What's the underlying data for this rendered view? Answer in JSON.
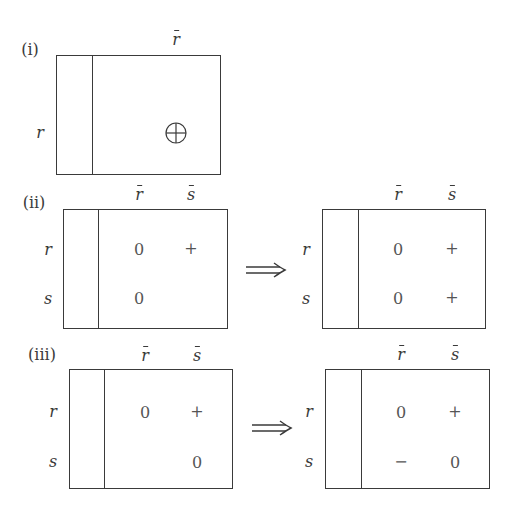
{
  "colors": {
    "line": "#3a3a3a",
    "text": "#3a3a3a",
    "cell_text": "#555555",
    "background": "#ffffff"
  },
  "panels": [
    {
      "label": "(i)",
      "column_headers": [
        "r"
      ],
      "row_headers": [
        "r"
      ],
      "diagrams": [
        {
          "cells": [
            {
              "row": "r",
              "col": "r̄",
              "symbol": "⊕",
              "icon": "circled-plus-icon"
            }
          ]
        }
      ]
    },
    {
      "label": "(ii)",
      "column_headers": [
        "r",
        "s"
      ],
      "row_headers": [
        "r",
        "s"
      ],
      "arrow": "⟹",
      "diagrams": [
        {
          "cells": [
            {
              "row": "r",
              "col": "r̄",
              "value": "0"
            },
            {
              "row": "r",
              "col": "s̄",
              "value": "+"
            },
            {
              "row": "s",
              "col": "r̄",
              "value": "0"
            },
            {
              "row": "s",
              "col": "s̄",
              "value": ""
            }
          ]
        },
        {
          "cells": [
            {
              "row": "r",
              "col": "r̄",
              "value": "0"
            },
            {
              "row": "r",
              "col": "s̄",
              "value": "+"
            },
            {
              "row": "s",
              "col": "r̄",
              "value": "0"
            },
            {
              "row": "s",
              "col": "s̄",
              "value": "+"
            }
          ]
        }
      ]
    },
    {
      "label": "(iii)",
      "column_headers": [
        "r",
        "s"
      ],
      "row_headers": [
        "r",
        "s"
      ],
      "arrow": "⟹",
      "diagrams": [
        {
          "cells": [
            {
              "row": "r",
              "col": "r̄",
              "value": "0"
            },
            {
              "row": "r",
              "col": "s̄",
              "value": "+"
            },
            {
              "row": "s",
              "col": "r̄",
              "value": ""
            },
            {
              "row": "s",
              "col": "s̄",
              "value": "0"
            }
          ]
        },
        {
          "cells": [
            {
              "row": "r",
              "col": "r̄",
              "value": "0"
            },
            {
              "row": "r",
              "col": "s̄",
              "value": "+"
            },
            {
              "row": "s",
              "col": "r̄",
              "value": "−"
            },
            {
              "row": "s",
              "col": "s̄",
              "value": "0"
            }
          ]
        }
      ]
    }
  ]
}
